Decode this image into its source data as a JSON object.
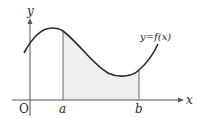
{
  "diagram": {
    "labels": {
      "y_axis": "y",
      "x_axis": "x",
      "origin": "O",
      "a": "a",
      "b": "b",
      "function": "y=f(x)"
    },
    "colors": {
      "curve": "#2a2a2a",
      "axes": "#555555",
      "shaded_region": "#efefef",
      "bounds": "#666666"
    }
  }
}
